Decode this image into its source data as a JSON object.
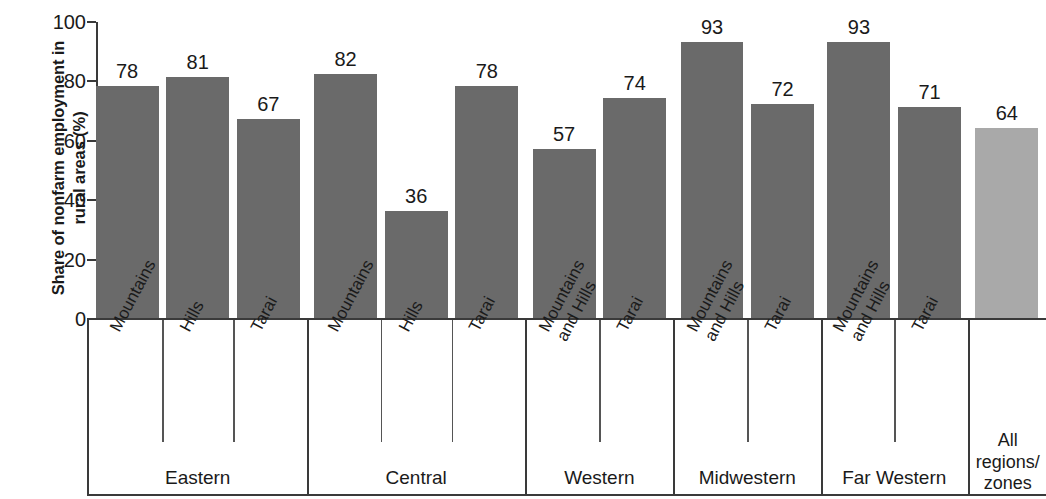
{
  "chart_data": {
    "type": "bar",
    "title": "",
    "xlabel": "",
    "ylabel": "Share of nonfarm employment in rural areas (%)",
    "ylim": [
      0,
      100
    ],
    "yticks": [
      0,
      20,
      40,
      60,
      80,
      100
    ],
    "grid": false,
    "legend": "none",
    "categories": [
      "Mountains",
      "Hills",
      "Tarai",
      "Mountains",
      "Hills",
      "Tarai",
      "Mountains and Hills",
      "Tarai",
      "Mountains and Hills",
      "Tarai",
      "Mountains and Hills",
      "Tarai",
      "All regions/zones"
    ],
    "values": [
      78,
      81,
      67,
      82,
      36,
      78,
      57,
      74,
      93,
      72,
      93,
      71,
      64
    ],
    "groups": [
      {
        "label": "Eastern",
        "count": 3
      },
      {
        "label": "Central",
        "count": 3
      },
      {
        "label": "Western",
        "count": 2
      },
      {
        "label": "Midwestern",
        "count": 2
      },
      {
        "label": "Far Western",
        "count": 2
      },
      {
        "label": "All regions/zones",
        "count": 1
      }
    ],
    "colors": {
      "bar": "#6a6a6a",
      "bar_highlight": "#a9a9a9",
      "axis": "#3a3a3a",
      "text": "#1a1a1a"
    }
  },
  "axis": {
    "y_label_line1": "Share of nonfarm employment in",
    "y_label_line2": "rural areas (%)",
    "ytick_labels": [
      "100",
      "80",
      "60",
      "40",
      "20",
      "0"
    ]
  },
  "bars": [
    {
      "name": "bar-eastern-mountains",
      "value": 78,
      "label": "78",
      "sub": "Mountains",
      "shade": "dark"
    },
    {
      "name": "bar-eastern-hills",
      "value": 81,
      "label": "81",
      "sub": "Hills",
      "shade": "dark"
    },
    {
      "name": "bar-eastern-tarai",
      "value": 67,
      "label": "67",
      "sub": "Tarai",
      "shade": "dark"
    },
    {
      "name": "bar-central-mountains",
      "value": 82,
      "label": "82",
      "sub": "Mountains",
      "shade": "dark"
    },
    {
      "name": "bar-central-hills",
      "value": 36,
      "label": "36",
      "sub": "Hills",
      "shade": "dark"
    },
    {
      "name": "bar-central-tarai",
      "value": 78,
      "label": "78",
      "sub": "Tarai",
      "shade": "dark"
    },
    {
      "name": "bar-western-mountains-and-hills",
      "value": 57,
      "label": "57",
      "sub": "Mountains and Hills",
      "shade": "dark"
    },
    {
      "name": "bar-western-tarai",
      "value": 74,
      "label": "74",
      "sub": "Tarai",
      "shade": "dark"
    },
    {
      "name": "bar-midwestern-mountains-and-hills",
      "value": 93,
      "label": "93",
      "sub": "Mountains and Hills",
      "shade": "dark"
    },
    {
      "name": "bar-midwestern-tarai",
      "value": 72,
      "label": "72",
      "sub": "Tarai",
      "shade": "dark"
    },
    {
      "name": "bar-farwestern-mountains-and-hills",
      "value": 93,
      "label": "93",
      "sub": "Mountains and Hills",
      "shade": "dark"
    },
    {
      "name": "bar-farwestern-tarai",
      "value": 71,
      "label": "71",
      "sub": "Tarai",
      "shade": "dark"
    },
    {
      "name": "bar-all-regions-zones",
      "value": 64,
      "label": "64",
      "sub": "All regions/zones",
      "shade": "light"
    }
  ],
  "sub_labels": [
    "Mountains",
    "Hills",
    "Tarai",
    "Mountains",
    "Hills",
    "Tarai",
    "Mountains and Hills",
    "Tarai",
    "Mountains and Hills",
    "Tarai",
    "Mountains and Hills",
    "Tarai"
  ],
  "region_labels": [
    "Eastern",
    "Central",
    "Western",
    "Midwestern",
    "Far Western"
  ],
  "all_column": {
    "line1": "All",
    "line2": "regions/",
    "line3": "zones"
  }
}
